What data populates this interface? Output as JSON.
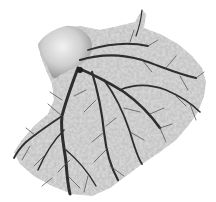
{
  "image": {
    "subject": "vascular-tree-cast",
    "description": "Grayscale photograph of a branching vascular/bronchial corrosion cast on white background",
    "width": 216,
    "height": 202,
    "colors": {
      "background": "#ffffff",
      "vessel_dark": "#2e2e2e",
      "vessel_mid": "#6a6a6a",
      "tissue_light": "#b8b8b8",
      "tissue_pale": "#dcdcdc"
    }
  }
}
